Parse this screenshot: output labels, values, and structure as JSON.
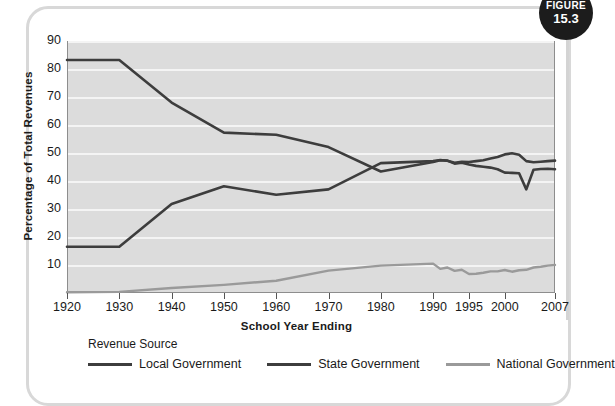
{
  "figure_badge": {
    "word": "FIGURE",
    "number": "15.3"
  },
  "chart_data": {
    "type": "line",
    "title": "",
    "xlabel": "School Year Ending",
    "ylabel": "Percentage of Total Revenues",
    "ylim": [
      0,
      90
    ],
    "yticks": [
      90,
      80,
      70,
      60,
      50,
      40,
      30,
      20,
      10
    ],
    "grid": true,
    "legend_position": "bottom",
    "legend_title": "Revenue Source",
    "x_tick_labels": [
      "1920",
      "1930",
      "1940",
      "1950",
      "1960",
      "1970",
      "1980",
      "1990",
      "1995",
      "2000",
      "2007"
    ],
    "categories": [
      "1920",
      "1930",
      "1940",
      "1950",
      "1960",
      "1970",
      "1980",
      "1990",
      "1991",
      "1992",
      "1993",
      "1994",
      "1995",
      "1996",
      "1997",
      "1998",
      "1999",
      "2000",
      "2001",
      "2002",
      "2003",
      "2004",
      "2005",
      "2006",
      "2007"
    ],
    "series": [
      {
        "name": "Local Government",
        "color": "#3d3d3d",
        "values": [
          83.2,
          83.2,
          68.0,
          57.3,
          56.5,
          52.1,
          43.4,
          46.8,
          47.4,
          47.3,
          46.2,
          46.5,
          45.9,
          45.4,
          45.1,
          44.8,
          44.2,
          43.0,
          42.9,
          42.8,
          37.0,
          44.0,
          44.3,
          44.4,
          44.2
        ]
      },
      {
        "name": "State Government",
        "color": "#3d3d3d",
        "values": [
          16.5,
          16.5,
          31.8,
          38.1,
          35.1,
          37.0,
          46.4,
          47.1,
          47.5,
          47.2,
          46.5,
          46.9,
          46.8,
          47.1,
          47.4,
          48.0,
          48.6,
          49.5,
          49.9,
          49.4,
          47.1,
          46.7,
          46.9,
          47.1,
          47.3
        ]
      },
      {
        "name": "National Government",
        "color": "#9a9a9a",
        "values": [
          0.3,
          0.4,
          1.8,
          2.9,
          4.4,
          8.0,
          9.8,
          10.5,
          8.6,
          9.1,
          7.9,
          8.3,
          6.8,
          6.9,
          7.2,
          7.7,
          7.7,
          8.2,
          7.6,
          8.1,
          8.3,
          9.1,
          9.4,
          9.8,
          10.0
        ]
      }
    ],
    "x_positions": {
      "1920": 0,
      "1930": 52,
      "1940": 106,
      "1950": 159,
      "1960": 212,
      "1970": 264,
      "1980": 317,
      "1990": 369,
      "1991": 380,
      "1992": 390,
      "1993": 401,
      "1994": 411,
      "1995": 422,
      "1996": 433,
      "1997": 443,
      "1998": 454,
      "1999": 464,
      "2000": 475,
      "2001": 485,
      "2002": 496,
      "2003": 507,
      "2004": 517,
      "2005": 528,
      "2006": 538,
      "2007": 488
    }
  }
}
